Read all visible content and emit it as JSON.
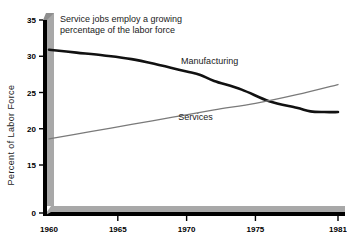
{
  "chart_data": {
    "type": "line",
    "title": "Service jobs employ a growing percentage of the labor force",
    "title_line1": "Service jobs employ a growing",
    "title_line2": "percentage of the labor force",
    "xlabel": "",
    "ylabel": "Percent of Labor Force",
    "xlim": [
      1960,
      1981
    ],
    "ylim": [
      15,
      35
    ],
    "grid": false,
    "legend_position": "inline-annotation",
    "y_ticks": [
      0,
      15,
      20,
      25,
      30,
      35
    ],
    "y_axis_broken": true,
    "y_axis_break_note": "axis jumps from 0 directly to 15",
    "x_ticks": [
      1960,
      1965,
      1970,
      1975,
      1981
    ],
    "x_tick_labels": [
      "1960",
      "1965",
      "1970",
      "1975",
      "1981"
    ],
    "series": [
      {
        "name": "Manufacturing",
        "color": "#111111",
        "width": 2.6,
        "x": [
          1960,
          1962,
          1964,
          1966,
          1968,
          1970,
          1971,
          1972,
          1974,
          1976,
          1978,
          1979,
          1980,
          1981
        ],
        "values": [
          30.9,
          30.5,
          30.1,
          29.6,
          28.8,
          27.9,
          27.4,
          26.6,
          25.4,
          23.8,
          22.9,
          22.4,
          22.3,
          22.3
        ]
      },
      {
        "name": "Services",
        "color": "#7a7a7a",
        "width": 1.3,
        "x": [
          1960,
          1963,
          1966,
          1969,
          1972,
          1975,
          1978,
          1981
        ],
        "values": [
          18.6,
          19.6,
          20.6,
          21.6,
          22.6,
          23.5,
          24.7,
          26.1
        ]
      }
    ],
    "annotations": [
      {
        "text": "Manufacturing",
        "x": 1969.6,
        "y": 28.9
      },
      {
        "text": "Services",
        "x": 1969.4,
        "y": 21.2
      }
    ],
    "style": {
      "axis_color": "#000000",
      "shadow_color": "#a8a8a8",
      "background": "#ffffff"
    }
  }
}
